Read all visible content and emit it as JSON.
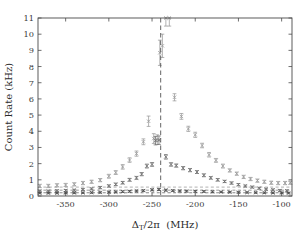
{
  "figure": {
    "title": "",
    "background": "#ffffff",
    "frame_color": "#4a4a4a"
  },
  "chart_data": {
    "type": "scatter",
    "title": "",
    "subtitle": "",
    "xlabel": "Δ_T/2π (MHz)",
    "ylabel": "Count Rate (kHz)",
    "xlim": [
      -382,
      -88
    ],
    "ylim": [
      0,
      11
    ],
    "xticks": [
      -350,
      -300,
      -250,
      -200,
      -150,
      -100
    ],
    "xticklabels": [
      "-350",
      "-300",
      "-250",
      "-200",
      "-150",
      "-100"
    ],
    "yticks": [
      0,
      1,
      2,
      3,
      4,
      5,
      6,
      7,
      8,
      9,
      10,
      11
    ],
    "yticklabels": [
      "0",
      "1",
      "2",
      "3",
      "4",
      "5",
      "6",
      "7",
      "8",
      "9",
      "10",
      "11"
    ],
    "grid": false,
    "legend": "none",
    "errorbars": true,
    "marker_style": "x-with-caps",
    "annotations": [
      {
        "name": "resonance-line",
        "type": "vertical-dashed-line",
        "x": -240,
        "label": "",
        "color": "#555555"
      }
    ],
    "series": [
      {
        "name": "high-power",
        "color": "#9a9a9a",
        "x": [
          -380,
          -370,
          -360,
          -350,
          -340,
          -330,
          -320,
          -310,
          -300,
          -292,
          -284,
          -276,
          -268,
          -260,
          -254,
          -248,
          -244,
          -241,
          -238,
          -234,
          -230,
          -224,
          -216,
          -208,
          -200,
          -192,
          -184,
          -176,
          -168,
          -160,
          -152,
          -144,
          -136,
          -128,
          -120,
          -112,
          -104,
          -96,
          -90
        ],
        "y": [
          0.62,
          0.62,
          0.66,
          0.68,
          0.72,
          0.8,
          0.88,
          0.98,
          1.22,
          1.45,
          1.8,
          2.22,
          2.62,
          3.35,
          4.62,
          3.55,
          3.48,
          8.85,
          9.28,
          11.0,
          11.0,
          6.1,
          4.92,
          4.15,
          3.78,
          3.12,
          2.55,
          2.2,
          1.85,
          1.58,
          1.38,
          1.18,
          1.05,
          0.95,
          0.88,
          0.82,
          0.8,
          0.8,
          0.82
        ],
        "yerr": [
          0.1,
          0.1,
          0.1,
          0.1,
          0.1,
          0.1,
          0.1,
          0.1,
          0.12,
          0.12,
          0.14,
          0.14,
          0.16,
          0.18,
          0.32,
          0.3,
          0.3,
          0.78,
          0.72,
          0.5,
          0.5,
          0.22,
          0.18,
          0.16,
          0.16,
          0.14,
          0.14,
          0.12,
          0.12,
          0.1,
          0.1,
          0.1,
          0.1,
          0.1,
          0.1,
          0.1,
          0.1,
          0.1,
          0.1
        ]
      },
      {
        "name": "mid-power",
        "color": "#6e6e6e",
        "x": [
          -380,
          -370,
          -360,
          -350,
          -340,
          -330,
          -320,
          -310,
          -300,
          -292,
          -284,
          -276,
          -268,
          -262,
          -256,
          -250,
          -246,
          -242,
          -234,
          -228,
          -222,
          -214,
          -206,
          -198,
          -190,
          -182,
          -174,
          -166,
          -158,
          -150,
          -142,
          -134,
          -126,
          -118,
          -110,
          -102,
          -94
        ],
        "y": [
          0.3,
          0.3,
          0.32,
          0.34,
          0.36,
          0.4,
          0.44,
          0.52,
          0.62,
          0.72,
          0.82,
          1.0,
          1.12,
          1.35,
          1.85,
          1.95,
          3.42,
          3.45,
          2.42,
          1.95,
          1.88,
          1.72,
          1.6,
          1.48,
          1.28,
          1.12,
          1.0,
          0.9,
          0.8,
          0.7,
          0.62,
          0.55,
          0.48,
          0.42,
          0.38,
          0.34,
          0.32
        ],
        "yerr": [
          0.06,
          0.06,
          0.06,
          0.06,
          0.06,
          0.06,
          0.06,
          0.07,
          0.07,
          0.08,
          0.08,
          0.09,
          0.09,
          0.1,
          0.12,
          0.12,
          0.26,
          0.26,
          0.14,
          0.11,
          0.1,
          0.1,
          0.1,
          0.09,
          0.09,
          0.08,
          0.08,
          0.07,
          0.07,
          0.07,
          0.06,
          0.06,
          0.06,
          0.06,
          0.06,
          0.06,
          0.06
        ]
      },
      {
        "name": "low-power",
        "color": "#4f4f4f",
        "x": [
          -380,
          -370,
          -360,
          -350,
          -340,
          -330,
          -320,
          -310,
          -300,
          -292,
          -284,
          -276,
          -268,
          -260,
          -250,
          -242,
          -234,
          -226,
          -218,
          -210,
          -200,
          -190,
          -180,
          -170,
          -160,
          -150,
          -140,
          -130,
          -120,
          -110,
          -100,
          -92
        ],
        "y": [
          0.18,
          0.18,
          0.18,
          0.19,
          0.19,
          0.2,
          0.21,
          0.22,
          0.24,
          0.25,
          0.27,
          0.29,
          0.31,
          0.33,
          0.38,
          0.4,
          0.36,
          0.33,
          0.31,
          0.3,
          0.29,
          0.28,
          0.26,
          0.25,
          0.24,
          0.23,
          0.22,
          0.21,
          0.2,
          0.19,
          0.19,
          0.18
        ],
        "yerr": [
          0.04,
          0.04,
          0.04,
          0.04,
          0.04,
          0.04,
          0.04,
          0.04,
          0.05,
          0.05,
          0.05,
          0.05,
          0.05,
          0.05,
          0.06,
          0.06,
          0.06,
          0.05,
          0.05,
          0.05,
          0.05,
          0.05,
          0.05,
          0.04,
          0.04,
          0.04,
          0.04,
          0.04,
          0.04,
          0.04,
          0.04,
          0.04
        ]
      }
    ],
    "baselines": [
      {
        "name": "baseline-upper",
        "y": 0.55,
        "color": "#a8a8a8"
      },
      {
        "name": "baseline-middle",
        "y": 0.36,
        "color": "#8f8f8f"
      },
      {
        "name": "baseline-lower",
        "y": 0.2,
        "color": "#7a7a7a"
      }
    ]
  }
}
